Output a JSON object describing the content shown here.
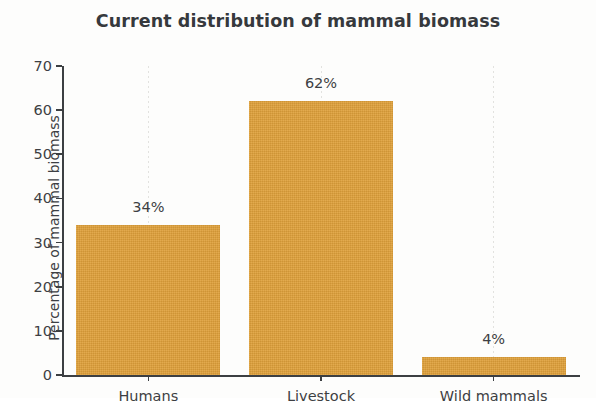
{
  "chart_data": {
    "type": "bar",
    "title": "Current distribution of mammal biomass",
    "xlabel": "",
    "ylabel": "Percentage of mammal biomass",
    "categories": [
      "Humans",
      "Livestock",
      "Wild mammals"
    ],
    "values": [
      34,
      62,
      4
    ],
    "value_labels": [
      "34%",
      "62%",
      "4%"
    ],
    "ylim": [
      0,
      70
    ],
    "yticks": [
      0,
      10,
      20,
      30,
      40,
      50,
      60,
      70
    ],
    "ytick_labels": [
      "0",
      "10",
      "20",
      "30",
      "40",
      "50",
      "60",
      "70"
    ],
    "grid": "vertical-dotted",
    "legend": "none",
    "bar_color": "#dfa03a",
    "text_color": "#3d3f43",
    "axis_color": "#3c3f42",
    "background_color": "#fdfdfc"
  }
}
